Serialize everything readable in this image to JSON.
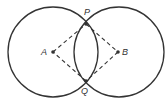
{
  "diagram": {
    "type": "geometry-construction",
    "stroke_color": "#333333",
    "background": "#ffffff",
    "circles": [
      {
        "name": "circle-A",
        "cx": 53,
        "cy": 52,
        "r": 45
      },
      {
        "name": "circle-B",
        "cx": 119,
        "cy": 52,
        "r": 45
      }
    ],
    "points": {
      "A": {
        "label": "A",
        "x": 53,
        "y": 52,
        "label_x": 42,
        "label_y": 55
      },
      "B": {
        "label": "B",
        "x": 118,
        "y": 52,
        "label_x": 122,
        "label_y": 55
      },
      "P": {
        "label": "P",
        "x": 86,
        "y": 24,
        "label_x": 84,
        "label_y": 15
      },
      "Q": {
        "label": "Q",
        "x": 86,
        "y": 81,
        "label_x": 81,
        "label_y": 94
      }
    },
    "dashed_segments": [
      [
        "A",
        "P"
      ],
      [
        "P",
        "B"
      ],
      [
        "B",
        "Q"
      ],
      [
        "Q",
        "A"
      ]
    ]
  }
}
